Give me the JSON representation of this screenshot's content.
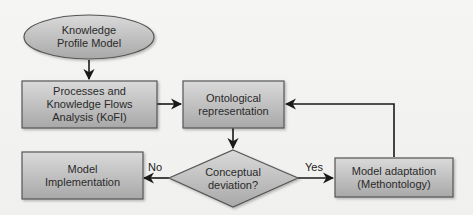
{
  "diagram": {
    "type": "flowchart",
    "nodes": [
      {
        "id": "knowledge_profile_model",
        "shape": "ellipse",
        "label": "Knowledge\nProfile Model"
      },
      {
        "id": "kofi_analysis",
        "shape": "rect",
        "label": "Processes and\nKnowledge Flows\nAnalysis (KoFI)"
      },
      {
        "id": "ontological_representation",
        "shape": "rect",
        "label": "Ontological\nrepresentation"
      },
      {
        "id": "conceptual_deviation",
        "shape": "diamond",
        "label": "Conceptual\ndeviation?"
      },
      {
        "id": "model_implementation",
        "shape": "rect",
        "label": "Model\nImplementation"
      },
      {
        "id": "model_adaptation",
        "shape": "rect",
        "label": "Model adaptation\n(Methontology)"
      }
    ],
    "edges": [
      {
        "from": "knowledge_profile_model",
        "to": "kofi_analysis",
        "label": ""
      },
      {
        "from": "kofi_analysis",
        "to": "ontological_representation",
        "label": ""
      },
      {
        "from": "ontological_representation",
        "to": "conceptual_deviation",
        "label": ""
      },
      {
        "from": "conceptual_deviation",
        "to": "model_implementation",
        "label": "No"
      },
      {
        "from": "conceptual_deviation",
        "to": "model_adaptation",
        "label": "Yes"
      },
      {
        "from": "model_adaptation",
        "to": "ontological_representation",
        "label": ""
      }
    ],
    "edge_labels": {
      "no": "No",
      "yes": "Yes"
    },
    "colors": {
      "node_fill_top": "#d6d6d6",
      "node_fill_bottom": "#a9a9a9",
      "node_stroke": "#555555",
      "edge": "#1a1a1a",
      "background": "#f3f3f1"
    }
  }
}
